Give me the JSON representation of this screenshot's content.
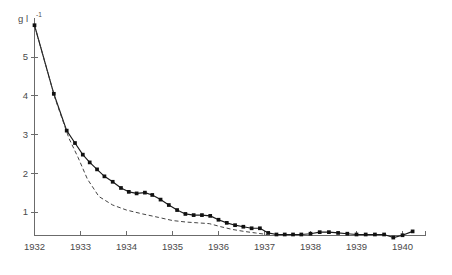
{
  "figure": {
    "background_color": "#ffffff",
    "axis_color": "#6b6b6b",
    "series_solid_color": "#1a1a1a",
    "series_dashed_color": "#3a3a3a"
  },
  "axis_label": {
    "unit_base": "g l",
    "unit_exponent": "-1"
  },
  "chart_data": {
    "type": "line",
    "title": "",
    "subtitle": "",
    "xlabel": "",
    "ylabel": "g l-1",
    "grid": false,
    "legend_position": "none",
    "xlim": [
      1932,
      1940.5
    ],
    "ylim": [
      0,
      6.0
    ],
    "xtick_labels": [
      "1932",
      "1933",
      "1934",
      "1935",
      "1936",
      "1937",
      "1938",
      "1939",
      "1940"
    ],
    "xtick_values": [
      1932,
      1933,
      1934,
      1935,
      1936,
      1937,
      1938,
      1939,
      1940
    ],
    "ytick_labels": [
      "1",
      "2",
      "3",
      "4",
      "5"
    ],
    "ytick_values": [
      1,
      2,
      3,
      4,
      5
    ],
    "series": [
      {
        "name": "solid-line-with-markers",
        "style": "solid",
        "marker": "square",
        "x": [
          1932.0,
          1932.42,
          1932.7,
          1932.88,
          1933.05,
          1933.2,
          1933.36,
          1933.52,
          1933.7,
          1933.88,
          1934.05,
          1934.22,
          1934.4,
          1934.56,
          1934.74,
          1934.92,
          1935.1,
          1935.28,
          1935.46,
          1935.64,
          1935.82,
          1936.0,
          1936.18,
          1936.36,
          1936.54,
          1936.72,
          1936.9,
          1937.08,
          1937.26,
          1937.44,
          1937.62,
          1937.8,
          1938.0,
          1938.2,
          1938.4,
          1938.6,
          1938.8,
          1939.0,
          1939.2,
          1939.4,
          1939.6,
          1939.8,
          1940.0,
          1940.22
        ],
        "y": [
          5.82,
          4.05,
          3.1,
          2.78,
          2.48,
          2.28,
          2.1,
          1.92,
          1.78,
          1.62,
          1.52,
          1.48,
          1.5,
          1.44,
          1.32,
          1.18,
          1.05,
          0.95,
          0.92,
          0.92,
          0.9,
          0.8,
          0.72,
          0.66,
          0.62,
          0.58,
          0.58,
          0.46,
          0.42,
          0.42,
          0.42,
          0.42,
          0.44,
          0.48,
          0.48,
          0.46,
          0.44,
          0.42,
          0.42,
          0.42,
          0.42,
          0.34,
          0.4,
          0.5
        ]
      },
      {
        "name": "dashed-line",
        "style": "dashed",
        "marker": "none",
        "x": [
          1932.0,
          1932.45,
          1932.75,
          1932.95,
          1933.15,
          1933.4,
          1933.7,
          1934.0,
          1934.35,
          1934.7,
          1935.0,
          1935.3,
          1935.55,
          1935.8,
          1936.05,
          1936.3,
          1936.55,
          1936.8,
          1937.05
        ],
        "y": [
          5.82,
          3.92,
          2.9,
          2.4,
          1.85,
          1.4,
          1.18,
          1.05,
          0.95,
          0.86,
          0.78,
          0.74,
          0.72,
          0.7,
          0.62,
          0.55,
          0.5,
          0.46,
          0.42
        ]
      }
    ]
  }
}
